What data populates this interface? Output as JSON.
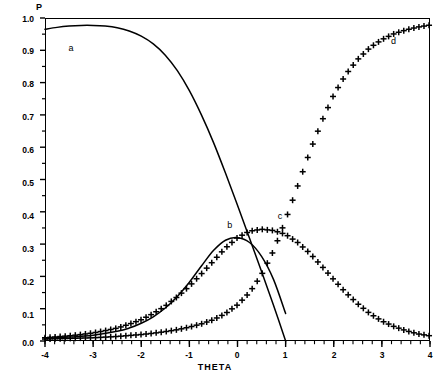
{
  "figure": {
    "y_axis_title": "P",
    "x_axis_title": "THETA"
  },
  "axis": {
    "y_ticks": [
      "1.0",
      "0.9",
      "0.8",
      "0.7",
      "0.6",
      "0.5",
      "0.4",
      "0.3",
      "0.2",
      "0.1",
      "0.0"
    ],
    "x_ticks": [
      "-4",
      "-3",
      "-2",
      "-1",
      "0",
      "1",
      "2",
      "3",
      "4"
    ]
  },
  "curve_labels": {
    "a": "a",
    "b": "b",
    "c": "c",
    "d": "d"
  },
  "chart_data": {
    "type": "line",
    "title": "",
    "subtitle": "",
    "xlabel": "THETA",
    "ylabel": "P",
    "xlim": [
      -4,
      4
    ],
    "ylim": [
      0.0,
      1.0
    ],
    "xticks": [
      -4,
      -3,
      -2,
      -1,
      0,
      1,
      2,
      3,
      4
    ],
    "yticks": [
      0.0,
      0.1,
      0.2,
      0.3,
      0.4,
      0.5,
      0.6,
      0.7,
      0.8,
      0.9,
      1.0
    ],
    "grid": false,
    "legend": "inline annotations a, b, c, d placed next to curves",
    "annotations": [
      {
        "text": "a",
        "x": -3.45,
        "y": 0.905
      },
      {
        "text": "b",
        "x": -0.15,
        "y": 0.355
      },
      {
        "text": "c",
        "x": 0.9,
        "y": 0.385
      },
      {
        "text": "d",
        "x": 3.25,
        "y": 0.925
      }
    ],
    "series": [
      {
        "name": "a",
        "style": "solid-line",
        "marker": "none",
        "color": "#000000",
        "x": [
          -4.0,
          -3.75,
          -3.5,
          -3.25,
          -3.0,
          -2.75,
          -2.5,
          -2.25,
          -2.0,
          -1.75,
          -1.5,
          -1.25,
          -1.0,
          -0.75,
          -0.5,
          -0.25,
          0.0,
          0.25,
          0.5,
          0.75,
          1.0
        ],
        "y": [
          0.965,
          0.971,
          0.975,
          0.977,
          0.977,
          0.975,
          0.97,
          0.96,
          0.944,
          0.92,
          0.885,
          0.837,
          0.775,
          0.7,
          0.615,
          0.52,
          0.42,
          0.318,
          0.215,
          0.11,
          0.0
        ]
      },
      {
        "name": "b",
        "style": "solid-line",
        "marker": "none",
        "color": "#000000",
        "x": [
          -4.0,
          -3.5,
          -3.0,
          -2.5,
          -2.25,
          -2.0,
          -1.75,
          -1.5,
          -1.25,
          -1.0,
          -0.75,
          -0.5,
          -0.25,
          0.0,
          0.25,
          0.5,
          0.75,
          1.0
        ],
        "y": [
          0.008,
          0.012,
          0.018,
          0.03,
          0.04,
          0.055,
          0.075,
          0.102,
          0.138,
          0.182,
          0.232,
          0.28,
          0.312,
          0.32,
          0.305,
          0.262,
          0.19,
          0.085
        ]
      },
      {
        "name": "c",
        "style": "plus-markers",
        "marker": "+",
        "color": "#000000",
        "x": [
          -4.0,
          -3.75,
          -3.5,
          -3.25,
          -3.0,
          -2.75,
          -2.5,
          -2.25,
          -2.0,
          -1.75,
          -1.5,
          -1.25,
          -1.0,
          -0.75,
          -0.5,
          -0.25,
          0.0,
          0.25,
          0.5,
          0.75,
          1.0,
          1.25,
          1.5,
          1.75,
          2.0,
          2.25,
          2.5,
          2.75,
          3.0,
          3.25,
          3.5,
          3.75,
          4.0
        ],
        "y": [
          0.01,
          0.013,
          0.016,
          0.02,
          0.025,
          0.032,
          0.04,
          0.052,
          0.066,
          0.085,
          0.108,
          0.137,
          0.17,
          0.208,
          0.248,
          0.288,
          0.32,
          0.34,
          0.346,
          0.342,
          0.33,
          0.305,
          0.272,
          0.232,
          0.19,
          0.15,
          0.115,
          0.085,
          0.062,
          0.045,
          0.032,
          0.022,
          0.016
        ]
      },
      {
        "name": "d",
        "style": "plus-markers",
        "marker": "+",
        "color": "#000000",
        "x": [
          -4.0,
          -3.75,
          -3.5,
          -3.25,
          -3.0,
          -2.75,
          -2.5,
          -2.25,
          -2.0,
          -1.75,
          -1.5,
          -1.25,
          -1.0,
          -0.75,
          -0.5,
          -0.25,
          0.0,
          0.25,
          0.5,
          0.75,
          1.0,
          1.25,
          1.5,
          1.75,
          2.0,
          2.25,
          2.5,
          2.75,
          3.0,
          3.25,
          3.5,
          3.75,
          4.0
        ],
        "y": [
          0.006,
          0.007,
          0.008,
          0.009,
          0.01,
          0.012,
          0.014,
          0.017,
          0.02,
          0.024,
          0.029,
          0.035,
          0.043,
          0.053,
          0.066,
          0.085,
          0.112,
          0.15,
          0.205,
          0.28,
          0.375,
          0.48,
          0.585,
          0.68,
          0.762,
          0.825,
          0.872,
          0.908,
          0.933,
          0.951,
          0.963,
          0.972,
          0.978
        ]
      }
    ]
  }
}
